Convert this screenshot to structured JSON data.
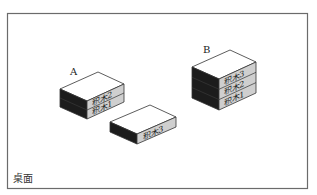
{
  "figure": {
    "surface_label": "桌面",
    "stacks": [
      {
        "id": "A",
        "label": "A",
        "blocks": [
          "积木2",
          "积木1"
        ]
      },
      {
        "id": "B",
        "label": "B",
        "blocks": [
          "积木3",
          "积木2",
          "积木1"
        ]
      },
      {
        "id": "single",
        "label": "",
        "blocks": [
          "积木3"
        ]
      }
    ],
    "colors": {
      "frame": "#6b6b6b",
      "top_face": "#ffffff",
      "left_face": "#1c1c1c",
      "right_face": "#cfcfcf",
      "edge": "#333333",
      "text": "#222222"
    }
  }
}
